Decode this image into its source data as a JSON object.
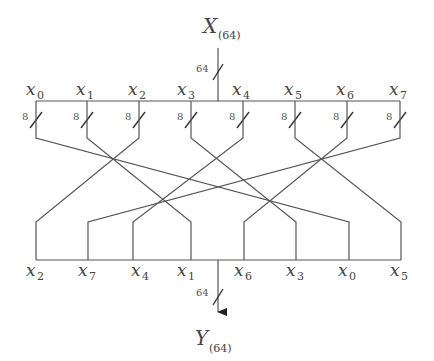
{
  "diagram": {
    "type": "bit-permutation network",
    "input": {
      "label": "X",
      "subscript": "(64)",
      "width_label": "64"
    },
    "output": {
      "label": "Y",
      "subscript": "(64)",
      "width_label": "64"
    },
    "top_labels": [
      {
        "var": "x",
        "sub": "0",
        "width": "8"
      },
      {
        "var": "x",
        "sub": "1",
        "width": "8"
      },
      {
        "var": "x",
        "sub": "2",
        "width": "8"
      },
      {
        "var": "x",
        "sub": "3",
        "width": "8"
      },
      {
        "var": "x",
        "sub": "4",
        "width": "8"
      },
      {
        "var": "x",
        "sub": "5",
        "width": "8"
      },
      {
        "var": "x",
        "sub": "6",
        "width": "8"
      },
      {
        "var": "x",
        "sub": "7",
        "width": "8"
      }
    ],
    "bottom_labels": [
      {
        "var": "x",
        "sub": "2"
      },
      {
        "var": "x",
        "sub": "7"
      },
      {
        "var": "x",
        "sub": "4"
      },
      {
        "var": "x",
        "sub": "1"
      },
      {
        "var": "x",
        "sub": "6"
      },
      {
        "var": "x",
        "sub": "3"
      },
      {
        "var": "x",
        "sub": "0"
      },
      {
        "var": "x",
        "sub": "5"
      }
    ],
    "permutation": {
      "x0": 6,
      "x1": 3,
      "x2": 0,
      "x3": 5,
      "x4": 2,
      "x5": 7,
      "x6": 4,
      "x7": 1
    }
  }
}
